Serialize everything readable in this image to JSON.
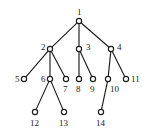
{
  "figure": {
    "type": "rooted-tree-diagram",
    "title": "",
    "width": 150,
    "height": 136,
    "background_color": "#ffffff",
    "stroke_color": "#1d1d1d",
    "node_fill_color": "#ffffff",
    "label_color": "#1a1a1a"
  },
  "chart_data": {
    "type": "diagram",
    "title": "",
    "nodes": [
      {
        "id": "1",
        "label": "1",
        "x": 79,
        "y": 21,
        "level": 0,
        "label_x": 77,
        "label_y": 8,
        "label_pos": "above"
      },
      {
        "id": "2",
        "label": "2",
        "x": 50,
        "y": 49,
        "level": 1,
        "label_x": 41,
        "label_y": 43,
        "label_pos": "left"
      },
      {
        "id": "3",
        "label": "3",
        "x": 79,
        "y": 49,
        "level": 1,
        "label_x": 86,
        "label_y": 43,
        "label_pos": "right"
      },
      {
        "id": "4",
        "label": "4",
        "x": 111,
        "y": 49,
        "level": 1,
        "label_x": 117,
        "label_y": 43,
        "label_pos": "right"
      },
      {
        "id": "5",
        "label": "5",
        "x": 24,
        "y": 79,
        "level": 2,
        "label_x": 15,
        "label_y": 75,
        "label_pos": "left"
      },
      {
        "id": "6",
        "label": "6",
        "x": 50,
        "y": 79,
        "level": 2,
        "label_x": 41,
        "label_y": 75,
        "label_pos": "left"
      },
      {
        "id": "7",
        "label": "7",
        "x": 66,
        "y": 79,
        "level": 2,
        "label_x": 63,
        "label_y": 85,
        "label_pos": "below"
      },
      {
        "id": "8",
        "label": "8",
        "x": 79,
        "y": 79,
        "level": 2,
        "label_x": 76,
        "label_y": 85,
        "label_pos": "below"
      },
      {
        "id": "9",
        "label": "9",
        "x": 93,
        "y": 79,
        "level": 2,
        "label_x": 90,
        "label_y": 85,
        "label_pos": "below"
      },
      {
        "id": "10",
        "label": "10",
        "x": 108,
        "y": 79,
        "level": 2,
        "label_x": 110,
        "label_y": 85,
        "label_pos": "below-right"
      },
      {
        "id": "11",
        "label": "11",
        "x": 126,
        "y": 79,
        "level": 2,
        "label_x": 131,
        "label_y": 75,
        "label_pos": "right"
      },
      {
        "id": "12",
        "label": "12",
        "x": 35,
        "y": 112,
        "level": 3,
        "label_x": 30,
        "label_y": 119,
        "label_pos": "below"
      },
      {
        "id": "13",
        "label": "13",
        "x": 64,
        "y": 112,
        "level": 3,
        "label_x": 59,
        "label_y": 119,
        "label_pos": "below"
      },
      {
        "id": "14",
        "label": "14",
        "x": 101,
        "y": 112,
        "level": 3,
        "label_x": 96,
        "label_y": 119,
        "label_pos": "below"
      }
    ],
    "edges": [
      {
        "from": "1",
        "to": "2"
      },
      {
        "from": "1",
        "to": "3"
      },
      {
        "from": "1",
        "to": "4"
      },
      {
        "from": "2",
        "to": "5"
      },
      {
        "from": "2",
        "to": "6"
      },
      {
        "from": "2",
        "to": "7"
      },
      {
        "from": "3",
        "to": "8"
      },
      {
        "from": "3",
        "to": "9"
      },
      {
        "from": "4",
        "to": "10"
      },
      {
        "from": "4",
        "to": "11"
      },
      {
        "from": "6",
        "to": "12"
      },
      {
        "from": "6",
        "to": "13"
      },
      {
        "from": "10",
        "to": "14"
      }
    ],
    "root": "1",
    "node_radius": 2.6,
    "legend": [],
    "annotations": []
  }
}
